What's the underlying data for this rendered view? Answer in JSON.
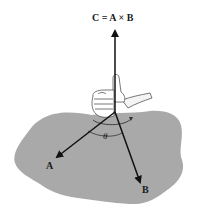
{
  "figure": {
    "equation_label": "C = A × B",
    "vectors": [
      {
        "name": "C",
        "label": "C",
        "direction": "up"
      },
      {
        "name": "A",
        "label": "A",
        "direction": "down-left"
      },
      {
        "name": "B",
        "label": "B",
        "direction": "down-right"
      }
    ],
    "angle_label": "θ",
    "labels": {
      "a": "A",
      "b": "B",
      "theta": "θ"
    },
    "colors": {
      "plane": "#a9a9a9",
      "arrows": "#111111",
      "hand_outline": "#555555",
      "background": "#ffffff"
    }
  }
}
